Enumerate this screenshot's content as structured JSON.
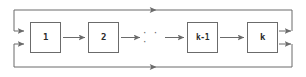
{
  "diagram": {
    "type": "flow-chain-with-feedback",
    "title": "",
    "background_color": "#ffffff",
    "line_color": "#6b6b6b",
    "text_color": "#2b2b2b",
    "nodes": [
      {
        "id": "node-1",
        "label": "1",
        "x": 30,
        "y": 22,
        "width": 31,
        "height": 31,
        "font_size": 9
      },
      {
        "id": "node-2",
        "label": "2",
        "x": 88,
        "y": 22,
        "width": 31,
        "height": 31,
        "font_size": 9
      },
      {
        "id": "node-km1",
        "label": "k-1",
        "x": 187,
        "y": 22,
        "width": 31,
        "height": 31,
        "font_size": 8
      },
      {
        "id": "node-k",
        "label": "k",
        "x": 247,
        "y": 22,
        "width": 31,
        "height": 31,
        "font_size": 9
      }
    ],
    "ellipsis": {
      "label": "· · ·",
      "x": 142,
      "y": 31,
      "font_size": 9
    },
    "connectors": [
      {
        "name": "arrow-1-to-2",
        "from": "node-1",
        "to": "node-2",
        "direction": "right"
      },
      {
        "name": "arrow-2-to-dots",
        "from": "node-2",
        "to": "ellipsis",
        "direction": "right"
      },
      {
        "name": "arrow-dots-to-km1",
        "from": "ellipsis",
        "to": "node-km1",
        "direction": "right"
      },
      {
        "name": "arrow-km1-to-k",
        "from": "node-km1",
        "to": "node-k",
        "direction": "right"
      }
    ],
    "feedback": {
      "outer_loop": {
        "left": 14,
        "top": 10,
        "right": 292,
        "bottom": 67
      },
      "top_return": {
        "name": "top-feedback-line",
        "direction": "left",
        "arrow_x": 153,
        "y": 10
      },
      "bottom_return": {
        "name": "bottom-feedback-line",
        "direction": "left",
        "arrow_x": 153,
        "y": 67
      },
      "inputs": [
        {
          "name": "feedback-input-upper",
          "y": 31
        },
        {
          "name": "feedback-input-lower",
          "y": 44
        }
      ],
      "outputs": [
        {
          "name": "feedback-output-upper",
          "y": 31
        },
        {
          "name": "feedback-output-lower",
          "y": 44
        }
      ]
    }
  }
}
